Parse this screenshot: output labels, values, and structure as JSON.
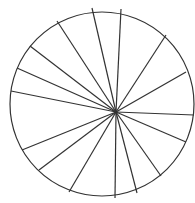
{
  "diagram": {
    "type": "circle-divided-into-sectors",
    "background": "#ffffff",
    "stroke_color": "#333333",
    "circle": {
      "cx": 102,
      "cy": 104,
      "r": 92
    },
    "hub": {
      "x": 116,
      "y": 112
    },
    "spoke_endpoints": [
      [
        92,
        8
      ],
      [
        121,
        9
      ],
      [
        166,
        35
      ],
      [
        186,
        72
      ],
      [
        194,
        115
      ],
      [
        186,
        142
      ],
      [
        161,
        176
      ],
      [
        137,
        193
      ],
      [
        115,
        198
      ],
      [
        69,
        192
      ],
      [
        39,
        170
      ],
      [
        22,
        150
      ],
      [
        11,
        91
      ],
      [
        17,
        68
      ],
      [
        30,
        46
      ],
      [
        57,
        21
      ]
    ],
    "sector_count": 16
  }
}
